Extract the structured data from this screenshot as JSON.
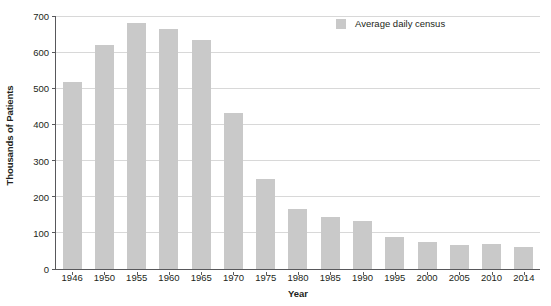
{
  "chart_data": {
    "type": "bar",
    "title": "",
    "xlabel": "Year",
    "ylabel": "Thousands of Patients",
    "categories": [
      "1946",
      "1950",
      "1955",
      "1960",
      "1965",
      "1970",
      "1975",
      "1980",
      "1985",
      "1990",
      "1995",
      "2000",
      "2005",
      "2010",
      "2014"
    ],
    "series": [
      {
        "name": "Average daily census",
        "color": "#c9c9c9",
        "values": [
          518,
          620,
          680,
          664,
          633,
          433,
          248,
          165,
          143,
          132,
          88,
          75,
          66,
          68,
          60
        ]
      }
    ],
    "ylim": [
      0,
      700
    ],
    "yticks": [
      0,
      100,
      200,
      300,
      400,
      500,
      600,
      700
    ],
    "ytick_labels": [
      "0",
      "100",
      "200",
      "300",
      "400",
      "500",
      "600",
      "700"
    ],
    "grid": "horizontal",
    "legend_position": "top-right-inside",
    "legend_entries": [
      "Average daily census"
    ]
  },
  "figure": {
    "background": "#ffffff",
    "axis_color": "#58585b",
    "gridline_color": "#d8d8d8",
    "text_color": "#231f20",
    "caption": ""
  }
}
